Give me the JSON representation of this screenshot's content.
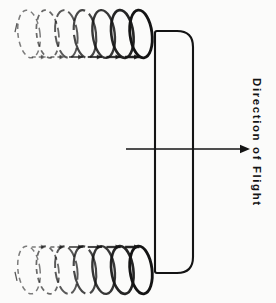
{
  "figure": {
    "background_color": "#fbfbfa",
    "ink_color": "#141414"
  },
  "annotations": {
    "flight_label": "Direction of Flight",
    "flight_label_rotation_deg": 90,
    "flight_arrow": {
      "name": "flight-direction-arrow",
      "x_start": 126,
      "x_end": 250,
      "y": 149,
      "head": "right"
    }
  },
  "wing": {
    "name": "wing-planform",
    "x": 155,
    "y": 31,
    "width": 38,
    "height": 242,
    "corner_radius_right": 16,
    "corner_radius_left": 2,
    "stroke_width": 2.1
  },
  "vortices": [
    {
      "name": "upper-trailing-vortex",
      "position": "top",
      "y_center": 34,
      "loop_count": 7,
      "loop_rx": 11,
      "loop_ry": 24,
      "x_start": 18,
      "x_end": 152,
      "rotation_sense": "clockwise",
      "arrow_side": "bottom",
      "fade": "left-dashed-to-right-solid"
    },
    {
      "name": "lower-trailing-vortex",
      "position": "bottom",
      "y_center": 270,
      "loop_count": 7,
      "loop_rx": 11,
      "loop_ry": 24,
      "x_start": 18,
      "x_end": 152,
      "rotation_sense": "counter-clockwise",
      "arrow_side": "top",
      "fade": "left-dashed-to-right-solid"
    }
  ],
  "chart_data": {
    "type": "diagram",
    "elements": [
      "upper-trailing-vortex",
      "lower-trailing-vortex",
      "wing-planform",
      "flight-direction-arrow",
      "Direction of Flight"
    ]
  }
}
